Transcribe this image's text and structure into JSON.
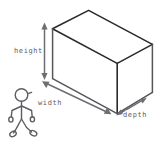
{
  "diagram": {
    "style": "hand-drawn sketch",
    "background_color": "#ffffff",
    "line_color": "#2b2b2b",
    "dimension_color": "#6d6e72",
    "label_color": "#5f6064",
    "figure_color": "#5d5e62"
  },
  "labels": {
    "height": "height",
    "width": "width",
    "depth": "depth"
  },
  "dimensions": [
    {
      "name": "height",
      "label": "height",
      "orientation": "vertical",
      "arrow_style": "double-headed",
      "position": "left of box front face"
    },
    {
      "name": "width",
      "label": "width",
      "orientation": "diagonal-down-right",
      "arrow_style": "double-headed",
      "position": "along bottom front-left edge"
    },
    {
      "name": "depth",
      "label": "depth",
      "orientation": "diagonal-up-right",
      "arrow_style": "double-headed",
      "position": "along bottom right receding edge"
    }
  ],
  "figures": {
    "person": {
      "name": "stick-figure-person",
      "pose": "walking",
      "parts": [
        "head",
        "torso",
        "left-arm",
        "right-arm",
        "left-leg",
        "right-leg",
        "left-foot",
        "right-foot"
      ]
    }
  },
  "box": {
    "name": "rectangular-prism",
    "visible_faces": [
      "top",
      "front",
      "right"
    ],
    "projection": "oblique"
  }
}
